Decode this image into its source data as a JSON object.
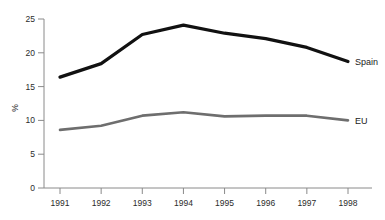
{
  "chart_data": {
    "type": "line",
    "title": "",
    "xlabel": "",
    "ylabel": "%",
    "x": [
      1991,
      1992,
      1993,
      1994,
      1995,
      1996,
      1997,
      1998
    ],
    "categories": [
      "1991",
      "1992",
      "1993",
      "1994",
      "1995",
      "1996",
      "1997",
      "1998"
    ],
    "xlim": [
      1991,
      1998
    ],
    "ylim": [
      0,
      25
    ],
    "yticks": [
      0,
      5,
      10,
      15,
      20,
      25
    ],
    "ytick_labels": [
      "0",
      "5",
      "10",
      "15",
      "20",
      "25"
    ],
    "grid": false,
    "legend_position": "right-inline-end-of-line",
    "series": [
      {
        "name": "Spain",
        "color": "#111111",
        "width": 3.2,
        "values": [
          16.4,
          18.4,
          22.7,
          24.1,
          22.9,
          22.1,
          20.8,
          18.7
        ]
      },
      {
        "name": "EU",
        "color": "#6e6e6e",
        "width": 2.6,
        "values": [
          8.6,
          9.2,
          10.7,
          11.2,
          10.6,
          10.7,
          10.7,
          10.0
        ]
      }
    ],
    "annotations": [
      {
        "text": "Spain",
        "series": "Spain",
        "at_x": 1998
      },
      {
        "text": "EU",
        "series": "EU",
        "at_x": 1998
      }
    ]
  },
  "axes": {
    "axis_color": "#8a8a8a",
    "tick_color": "#8a8a8a",
    "background": "#ffffff",
    "y_axis_title": "%"
  }
}
